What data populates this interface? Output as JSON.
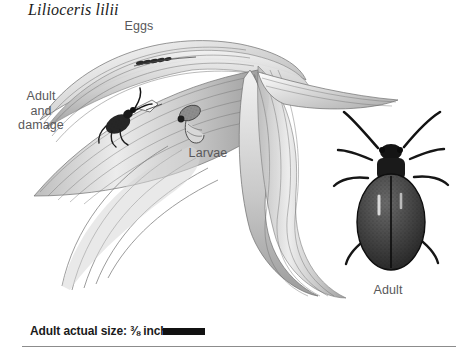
{
  "figure": {
    "title": "Lilioceris lilii",
    "background_color": "#ffffff",
    "ink_color": "#58585a",
    "accent_color": "#111111",
    "width": 470,
    "height": 354
  },
  "labels": {
    "eggs": "Eggs",
    "adult_and_damage": "Adult\nand\ndamage",
    "larvae": "Larvae",
    "adult": "Adult"
  },
  "caption": {
    "text": "Adult actual size: ⅜ inch",
    "scale_bar_color": "#111111"
  },
  "diagram_data": {
    "type": "scientific-illustration",
    "subject": "Lilioceris lilii",
    "common_subject": "lily leaf beetle life stages on lily foliage",
    "style": "grayscale pen-and-ink stipple drawing",
    "parts": [
      {
        "name": "eggs",
        "label": "Eggs",
        "description": "cluster of small elongated dark eggs in a row on the upper leaf surface",
        "position": {
          "x": 150,
          "y": 62
        }
      },
      {
        "name": "adult-on-leaf",
        "label": "Adult and damage",
        "description": "side view of adult beetle feeding, with pale chewed notch of leaf damage beside it",
        "position": {
          "x": 122,
          "y": 122
        }
      },
      {
        "name": "larva",
        "label": "Larvae",
        "description": "humped slug-like larva with dark head on the leaf blade",
        "position": {
          "x": 188,
          "y": 122
        }
      },
      {
        "name": "adult-dorsal",
        "label": "Adult",
        "description": "dorsal view of adult beetle, oval stippled elytra, long segmented antennae and six legs",
        "position": {
          "x": 392,
          "y": 200
        }
      },
      {
        "name": "lily-leaves",
        "label": "",
        "description": "long arching strap-shaped lily leaves with fine parallel veins, folding and twisting across the frame",
        "position": {
          "x": 200,
          "y": 160
        }
      }
    ]
  }
}
